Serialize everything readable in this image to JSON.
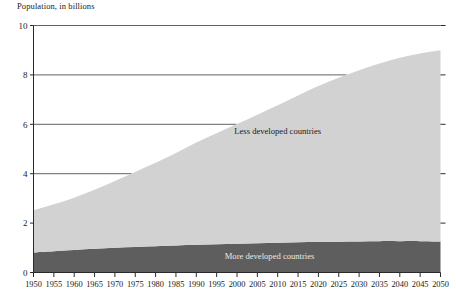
{
  "chart_data": {
    "type": "area",
    "title": "Population, in billions",
    "subtitle": "",
    "xlabel": "",
    "ylabel": "Population, in billions",
    "stacked": true,
    "grid": true,
    "legend_position": "inline-annotation",
    "xlim": [
      1950,
      2050
    ],
    "ylim": [
      0,
      10
    ],
    "ytick_values": [
      0,
      2,
      4,
      6,
      8,
      10
    ],
    "ytick_labels": [
      "0",
      "2",
      "4",
      "6",
      "8",
      "10"
    ],
    "x": [
      1950,
      1955,
      1960,
      1965,
      1970,
      1975,
      1980,
      1985,
      1990,
      1995,
      2000,
      2005,
      2010,
      2015,
      2020,
      2025,
      2030,
      2035,
      2040,
      2045,
      2050
    ],
    "xtick_labels": [
      "1950",
      "1955",
      "1960",
      "1965",
      "1970",
      "1975",
      "1980",
      "1985",
      "1990",
      "1995",
      "2000",
      "2005",
      "2010",
      "2015",
      "2020",
      "2025",
      "2030",
      "2035",
      "2040",
      "2045",
      "2050"
    ],
    "series": [
      {
        "name": "More developed countries",
        "color": "#5e5e5e",
        "label_color": "#e8e8e8",
        "values": [
          0.81,
          0.86,
          0.91,
          0.96,
          1.0,
          1.03,
          1.06,
          1.09,
          1.12,
          1.14,
          1.16,
          1.18,
          1.2,
          1.22,
          1.24,
          1.25,
          1.26,
          1.27,
          1.27,
          1.27,
          1.26
        ]
      },
      {
        "name": "Less developed countries",
        "color": "#d2d2d2",
        "label_color": "#1a1a1a",
        "values": [
          1.71,
          1.9,
          2.12,
          2.39,
          2.7,
          3.04,
          3.38,
          3.75,
          4.14,
          4.5,
          4.85,
          5.21,
          5.57,
          5.95,
          6.31,
          6.63,
          6.93,
          7.19,
          7.42,
          7.6,
          7.74
        ]
      }
    ],
    "totals": [
      2.52,
      2.76,
      3.03,
      3.35,
      3.7,
      4.07,
      4.44,
      4.84,
      5.26,
      5.64,
      6.01,
      6.39,
      6.77,
      7.17,
      7.55,
      7.88,
      8.19,
      8.46,
      8.69,
      8.87,
      9.0
    ],
    "annotations": [
      {
        "name": "less-developed-label",
        "text": "Less developed countries",
        "x": 2010,
        "y": 5.6
      },
      {
        "name": "more-developed-label",
        "text": "More developed countries",
        "x": 2008,
        "y": 0.55
      }
    ]
  },
  "colors": {
    "less_developed": "#d2d2d2",
    "more_developed": "#5e5e5e",
    "axis": "#2a2a2a",
    "gridline": "#3a3a3a",
    "background": "#ffffff",
    "text": "#1a1a1a"
  }
}
